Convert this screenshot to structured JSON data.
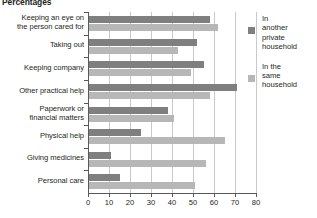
{
  "chart_data": {
    "type": "bar",
    "orientation": "horizontal",
    "title": "Percentages",
    "xlabel": "",
    "ylabel": "",
    "xlim": [
      0,
      80
    ],
    "xticks": [
      0,
      10,
      20,
      30,
      40,
      50,
      60,
      70,
      80
    ],
    "grid": true,
    "legend_position": "right",
    "categories": [
      "Keeping an eye on\nthe person cared for",
      "Taking out",
      "Keeping company",
      "Other practical help",
      "Paperwork or\nfinancial matters",
      "Physical help",
      "Giving medicines",
      "Personal care"
    ],
    "series": [
      {
        "name": "In another\nprivate\nhousehold",
        "color": "#7f7f7f",
        "values": [
          58,
          52,
          55,
          71,
          38,
          25,
          11,
          15
        ]
      },
      {
        "name": "In the\nsame\nhousehold",
        "color": "#b7b7b7",
        "values": [
          62,
          43,
          49,
          58,
          41,
          65,
          56,
          51
        ]
      }
    ]
  },
  "legend": {
    "items": [
      {
        "label": "In\nanother\nprivate\nhousehold",
        "color": "#7f7f7f"
      },
      {
        "label": "In the\nsame\nhousehold",
        "color": "#b7b7b7"
      }
    ]
  },
  "axis": {
    "tick_labels": [
      "0",
      "10",
      "20",
      "30",
      "40",
      "50",
      "60",
      "70",
      "80"
    ]
  }
}
